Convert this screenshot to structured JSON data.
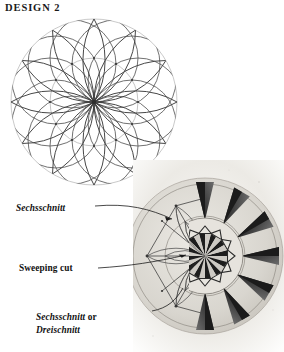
{
  "page": {
    "title": "DESIGN 2",
    "background_color": "#ffffff",
    "ink_color": "#111111"
  },
  "construction_diagram": {
    "name": "rosette-construction-diagram",
    "petal_count": 12,
    "outer_circle_color": "#b9b9b9",
    "inner_circle_color": "#b0b0b0",
    "arc_color": "#4a4a4a",
    "description": "Twelve-petal geometric rosette laid out with overlapping compass arcs inside a circle"
  },
  "photo": {
    "name": "carved-rosette-photo",
    "description": "Pencil layout lines on the left half and finished chip-carved twelve-point star rosette on the right half",
    "ray_count": 12,
    "paper_color": "#f2f1ee",
    "shadow_color": "#2b2b2b"
  },
  "callouts": [
    {
      "id": "sechsschnitt",
      "text": "Sechsschnitt",
      "style": "italic",
      "leader": "curve from label to upper-left carved point"
    },
    {
      "id": "sweeping-cut",
      "text": "Sweeping cut",
      "style": "roman",
      "leader": "curve from label to mid-left carved sweep"
    },
    {
      "id": "sechsschnitt-or-dreischnitt",
      "text_line1_italic": "Sechsschnitt",
      "text_line1_roman": " or",
      "text_line2_italic": "Dreischnitt",
      "style": "italic",
      "leader": "curve from label to lower carved point"
    }
  ]
}
